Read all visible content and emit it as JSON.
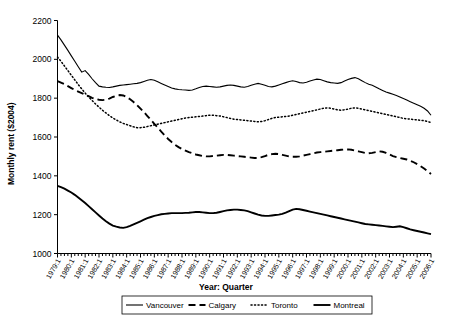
{
  "chart_data": {
    "type": "line",
    "title": "",
    "xlabel": "Year: Quarter",
    "ylabel": "Monthly rent ($2004)",
    "ylim": [
      1000,
      2200
    ],
    "yticks": [
      1000,
      1200,
      1400,
      1600,
      1800,
      2000,
      2200
    ],
    "grid": false,
    "legend_position": "bottom",
    "x_tick_labels": [
      "1979:1",
      "1980:1",
      "1981:1",
      "1982:1",
      "1983:1",
      "1984:1",
      "1985:1",
      "1986:1",
      "1987:1",
      "1988:1",
      "1989:1",
      "1990:1",
      "1991:1",
      "1992:1",
      "1993:1",
      "1994:1",
      "1995:1",
      "1996:1",
      "1997:1",
      "1998:1",
      "1999:1",
      "2000:1",
      "2001:1",
      "2002:1",
      "2003:1",
      "2004:1",
      "2005:1",
      "2006:1"
    ],
    "x_start": "1979:1",
    "x_end": "2006:1",
    "n_points": 109,
    "series": [
      {
        "name": "Vancouver",
        "style": "solid",
        "color": "#000000",
        "values": [
          2125,
          2100,
          2073,
          2046,
          2018,
          1990,
          1962,
          1934,
          1942,
          1922,
          1900,
          1880,
          1862,
          1858,
          1856,
          1855,
          1858,
          1862,
          1866,
          1868,
          1870,
          1872,
          1874,
          1876,
          1880,
          1886,
          1892,
          1896,
          1892,
          1884,
          1876,
          1868,
          1860,
          1852,
          1848,
          1845,
          1843,
          1842,
          1840,
          1842,
          1848,
          1855,
          1860,
          1862,
          1860,
          1858,
          1856,
          1858,
          1862,
          1866,
          1868,
          1866,
          1862,
          1858,
          1856,
          1860,
          1866,
          1872,
          1876,
          1872,
          1866,
          1860,
          1858,
          1862,
          1868,
          1874,
          1880,
          1886,
          1890,
          1886,
          1880,
          1878,
          1882,
          1888,
          1894,
          1898,
          1896,
          1890,
          1884,
          1880,
          1878,
          1876,
          1880,
          1888,
          1896,
          1902,
          1906,
          1900,
          1890,
          1880,
          1872,
          1866,
          1858,
          1848,
          1840,
          1832,
          1826,
          1820,
          1814,
          1806,
          1798,
          1790,
          1782,
          1774,
          1766,
          1758,
          1748,
          1734,
          1712
        ]
      },
      {
        "name": "Calgary",
        "style": "dashed",
        "color": "#000000",
        "values": [
          1888,
          1880,
          1872,
          1862,
          1852,
          1842,
          1834,
          1826,
          1818,
          1810,
          1802,
          1796,
          1792,
          1790,
          1792,
          1798,
          1806,
          1812,
          1816,
          1814,
          1806,
          1794,
          1780,
          1764,
          1746,
          1728,
          1708,
          1688,
          1668,
          1648,
          1628,
          1608,
          1590,
          1574,
          1560,
          1548,
          1538,
          1530,
          1522,
          1516,
          1510,
          1506,
          1502,
          1500,
          1500,
          1502,
          1504,
          1506,
          1508,
          1508,
          1506,
          1504,
          1502,
          1500,
          1498,
          1496,
          1494,
          1492,
          1492,
          1496,
          1502,
          1508,
          1512,
          1514,
          1512,
          1508,
          1504,
          1500,
          1498,
          1498,
          1500,
          1504,
          1508,
          1512,
          1516,
          1520,
          1522,
          1524,
          1526,
          1528,
          1530,
          1532,
          1534,
          1536,
          1536,
          1534,
          1530,
          1526,
          1522,
          1518,
          1516,
          1518,
          1522,
          1526,
          1524,
          1518,
          1510,
          1502,
          1496,
          1492,
          1488,
          1484,
          1478,
          1470,
          1460,
          1450,
          1438,
          1424,
          1410
        ]
      },
      {
        "name": "Toronto",
        "style": "dotted",
        "color": "#000000",
        "values": [
          2012,
          1990,
          1966,
          1942,
          1918,
          1894,
          1870,
          1848,
          1826,
          1806,
          1788,
          1770,
          1754,
          1738,
          1724,
          1710,
          1698,
          1688,
          1678,
          1670,
          1664,
          1658,
          1652,
          1648,
          1648,
          1650,
          1654,
          1658,
          1662,
          1666,
          1670,
          1674,
          1678,
          1682,
          1686,
          1690,
          1694,
          1698,
          1700,
          1702,
          1704,
          1706,
          1708,
          1710,
          1712,
          1712,
          1710,
          1708,
          1704,
          1700,
          1696,
          1692,
          1690,
          1688,
          1686,
          1684,
          1682,
          1680,
          1678,
          1680,
          1684,
          1690,
          1696,
          1700,
          1702,
          1704,
          1706,
          1708,
          1712,
          1716,
          1720,
          1724,
          1728,
          1732,
          1736,
          1740,
          1744,
          1748,
          1750,
          1748,
          1744,
          1740,
          1738,
          1740,
          1744,
          1748,
          1750,
          1748,
          1744,
          1740,
          1736,
          1732,
          1728,
          1724,
          1720,
          1716,
          1712,
          1708,
          1704,
          1700,
          1696,
          1694,
          1692,
          1690,
          1688,
          1686,
          1684,
          1680,
          1674
        ]
      },
      {
        "name": "Montreal",
        "style": "solid-thick",
        "color": "#000000",
        "values": [
          1348,
          1342,
          1334,
          1324,
          1314,
          1302,
          1288,
          1274,
          1260,
          1244,
          1228,
          1212,
          1196,
          1180,
          1166,
          1154,
          1144,
          1138,
          1134,
          1132,
          1136,
          1142,
          1150,
          1158,
          1166,
          1174,
          1182,
          1188,
          1194,
          1198,
          1202,
          1204,
          1206,
          1208,
          1208,
          1208,
          1208,
          1209,
          1210,
          1212,
          1214,
          1214,
          1212,
          1210,
          1208,
          1208,
          1210,
          1214,
          1218,
          1222,
          1224,
          1226,
          1226,
          1224,
          1222,
          1218,
          1212,
          1206,
          1200,
          1196,
          1194,
          1194,
          1196,
          1198,
          1200,
          1204,
          1210,
          1218,
          1226,
          1230,
          1228,
          1224,
          1220,
          1216,
          1212,
          1208,
          1204,
          1200,
          1196,
          1192,
          1188,
          1184,
          1180,
          1176,
          1172,
          1168,
          1164,
          1160,
          1156,
          1152,
          1150,
          1148,
          1146,
          1144,
          1142,
          1140,
          1138,
          1136,
          1138,
          1140,
          1136,
          1130,
          1124,
          1120,
          1116,
          1112,
          1108,
          1104,
          1100
        ]
      }
    ]
  },
  "legend": {
    "items": [
      {
        "label": "Vancouver",
        "style": "solid"
      },
      {
        "label": "Calgary",
        "style": "dashed"
      },
      {
        "label": "Toronto",
        "style": "dotted"
      },
      {
        "label": "Montreal",
        "style": "solid-thick"
      }
    ]
  }
}
